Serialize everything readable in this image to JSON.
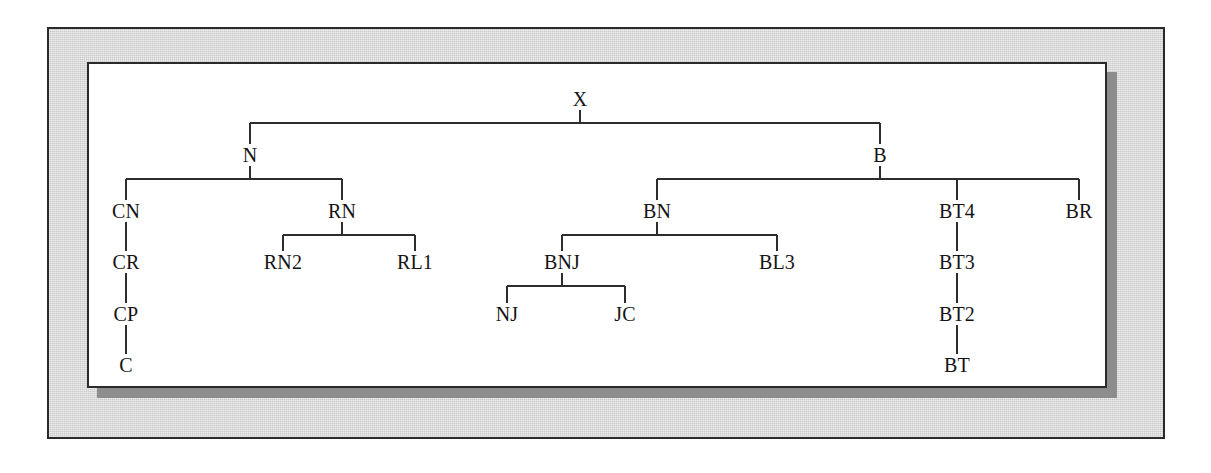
{
  "diagram": {
    "type": "tree",
    "root": "X",
    "colors": {
      "page_background": "#ffffff",
      "frame_mount": "#d6d6d6",
      "frame_border": "#2a2a2a",
      "canvas": "#ffffff",
      "shadow": "#8d8d8d",
      "edge": "#2d2d2d",
      "label": "#141414"
    },
    "nodes": [
      {
        "id": "X",
        "label": "X",
        "x": 491,
        "y": 35,
        "level": 0,
        "parent": null
      },
      {
        "id": "N",
        "label": "N",
        "x": 161,
        "y": 91,
        "level": 1,
        "parent": "X"
      },
      {
        "id": "B",
        "label": "B",
        "x": 791,
        "y": 91,
        "level": 1,
        "parent": "X"
      },
      {
        "id": "CN",
        "label": "CN",
        "x": 37,
        "y": 147,
        "level": 2,
        "parent": "N"
      },
      {
        "id": "RN",
        "label": "RN",
        "x": 253,
        "y": 147,
        "level": 2,
        "parent": "N"
      },
      {
        "id": "BN",
        "label": "BN",
        "x": 568,
        "y": 147,
        "level": 2,
        "parent": "B"
      },
      {
        "id": "BT4",
        "label": "BT4",
        "x": 868,
        "y": 147,
        "level": 2,
        "parent": "B"
      },
      {
        "id": "BR",
        "label": "BR",
        "x": 990,
        "y": 147,
        "level": 2,
        "parent": "B"
      },
      {
        "id": "CR",
        "label": "CR",
        "x": 37,
        "y": 198,
        "level": 3,
        "parent": "CN"
      },
      {
        "id": "RN2",
        "label": "RN2",
        "x": 194,
        "y": 198,
        "level": 3,
        "parent": "RN"
      },
      {
        "id": "RL1",
        "label": "RL1",
        "x": 326,
        "y": 198,
        "level": 3,
        "parent": "RN"
      },
      {
        "id": "BNJ",
        "label": "BNJ",
        "x": 473,
        "y": 198,
        "level": 3,
        "parent": "BN"
      },
      {
        "id": "BL3",
        "label": "BL3",
        "x": 688,
        "y": 198,
        "level": 3,
        "parent": "BN"
      },
      {
        "id": "BT3",
        "label": "BT3",
        "x": 868,
        "y": 198,
        "level": 3,
        "parent": "BT4"
      },
      {
        "id": "CP",
        "label": "CP",
        "x": 37,
        "y": 250,
        "level": 4,
        "parent": "CR"
      },
      {
        "id": "NJ",
        "label": "NJ",
        "x": 418,
        "y": 250,
        "level": 4,
        "parent": "BNJ"
      },
      {
        "id": "JC",
        "label": "JC",
        "x": 536,
        "y": 250,
        "level": 4,
        "parent": "BNJ"
      },
      {
        "id": "BT2",
        "label": "BT2",
        "x": 868,
        "y": 250,
        "level": 4,
        "parent": "BT3"
      },
      {
        "id": "C",
        "label": "C",
        "x": 37,
        "y": 301,
        "level": 5,
        "parent": "CP"
      },
      {
        "id": "BT",
        "label": "BT",
        "x": 868,
        "y": 301,
        "level": 5,
        "parent": "BT2"
      }
    ],
    "edges": [
      {
        "from": "X",
        "to": "N",
        "style": "elbow"
      },
      {
        "from": "X",
        "to": "B",
        "style": "elbow"
      },
      {
        "from": "N",
        "to": "CN",
        "style": "elbow"
      },
      {
        "from": "N",
        "to": "RN",
        "style": "elbow"
      },
      {
        "from": "B",
        "to": "BN",
        "style": "elbow"
      },
      {
        "from": "B",
        "to": "BT4",
        "style": "elbow"
      },
      {
        "from": "B",
        "to": "BR",
        "style": "elbow"
      },
      {
        "from": "CN",
        "to": "CR",
        "style": "straight"
      },
      {
        "from": "RN",
        "to": "RN2",
        "style": "elbow"
      },
      {
        "from": "RN",
        "to": "RL1",
        "style": "elbow"
      },
      {
        "from": "BN",
        "to": "BNJ",
        "style": "elbow"
      },
      {
        "from": "BN",
        "to": "BL3",
        "style": "elbow"
      },
      {
        "from": "BT4",
        "to": "BT3",
        "style": "straight"
      },
      {
        "from": "CR",
        "to": "CP",
        "style": "straight"
      },
      {
        "from": "BNJ",
        "to": "NJ",
        "style": "elbow"
      },
      {
        "from": "BNJ",
        "to": "JC",
        "style": "elbow"
      },
      {
        "from": "BT3",
        "to": "BT2",
        "style": "straight"
      },
      {
        "from": "CP",
        "to": "C",
        "style": "straight"
      },
      {
        "from": "BT2",
        "to": "BT",
        "style": "straight"
      }
    ]
  }
}
